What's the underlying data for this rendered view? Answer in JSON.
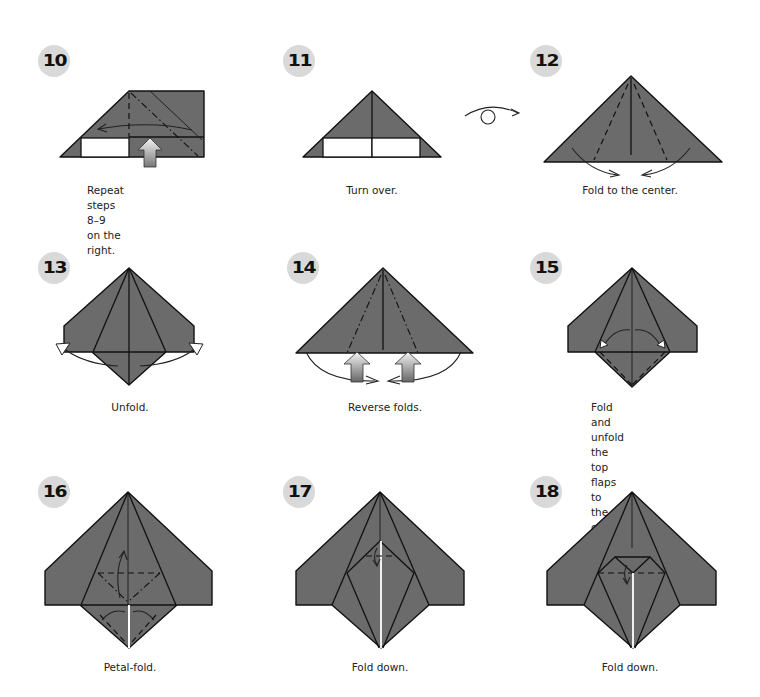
{
  "steps": [
    {
      "number": "10",
      "caption_lines": [
        "Repeat steps 8–9",
        "on the right."
      ]
    },
    {
      "number": "11",
      "caption_lines": [
        "Turn over."
      ]
    },
    {
      "number": "12",
      "caption_lines": [
        "Fold to the center."
      ]
    },
    {
      "number": "13",
      "caption_lines": [
        "Unfold."
      ]
    },
    {
      "number": "14",
      "caption_lines": [
        "Reverse folds."
      ]
    },
    {
      "number": "15",
      "caption_lines": [
        "Fold and unfold",
        "the top flaps to",
        "the center."
      ]
    },
    {
      "number": "16",
      "caption_lines": [
        "Petal-fold."
      ]
    },
    {
      "number": "17",
      "caption_lines": [
        "Fold down."
      ]
    },
    {
      "number": "18",
      "caption_lines": [
        "Fold down."
      ]
    }
  ],
  "colors": {
    "paper": "#6b6b6b",
    "badge": "#d9d9d9",
    "text": "#222222"
  },
  "icons": {
    "turn_over": "turn-over-symbol",
    "push_arrow": "push-arrow",
    "fold_arrow": "fold-arrow"
  }
}
